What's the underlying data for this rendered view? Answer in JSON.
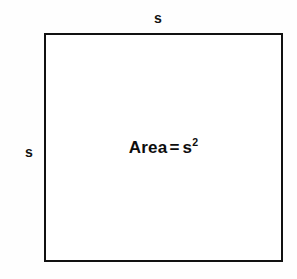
{
  "diagram": {
    "type": "geometry-figure",
    "shape": "square",
    "background_color": "#fefefe",
    "stroke_color": "#111111",
    "fill_color": "#ffffff",
    "stroke_width_px": 2.5,
    "labels": {
      "top_side": "s",
      "left_side": "s"
    },
    "formula": {
      "lhs": "Area",
      "operator": "=",
      "variable": "s",
      "exponent": "2",
      "full_text": "Area = s²"
    }
  }
}
